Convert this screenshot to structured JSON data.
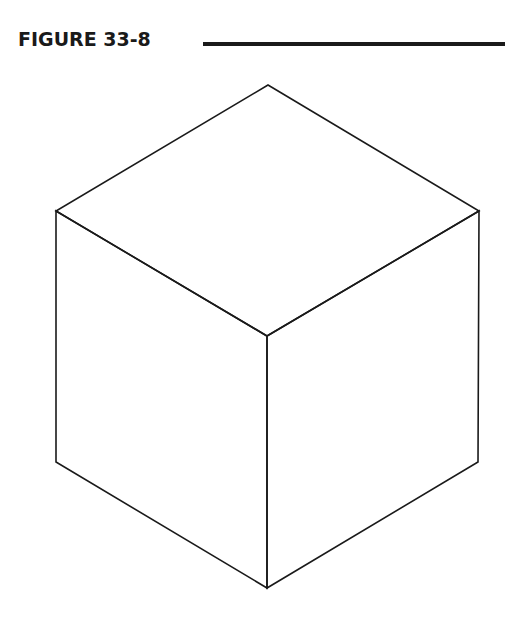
{
  "figure": {
    "label": "FIGURE 33-8",
    "rule_color": "#1a1a1a"
  },
  "diagram": {
    "type": "isometric-cube-wireframe",
    "stroke_color": "#1a1a1a",
    "stroke_width": 1.6,
    "vertices": {
      "top": [
        268,
        85
      ],
      "left_top": [
        56,
        211
      ],
      "right_top": [
        479,
        211
      ],
      "center": [
        267,
        336
      ],
      "left_bottom": [
        56,
        462
      ],
      "right_bottom": [
        478,
        462
      ],
      "bottom": [
        267,
        588
      ]
    },
    "faces": [
      "top",
      "left",
      "right"
    ]
  }
}
